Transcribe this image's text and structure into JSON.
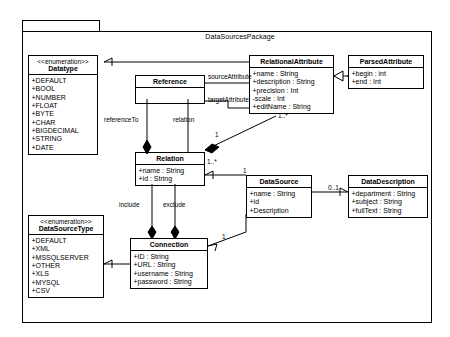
{
  "package": {
    "title": "DataSourcesPackage"
  },
  "classes": {
    "datatype": {
      "stereotype": "<<enumeration>>",
      "name": "Datatype",
      "members": [
        "+DEFAULT",
        "+BOOL",
        "+NUMBER",
        "+FLOAT",
        "+BYTE",
        "+CHAR",
        "+BIGDECIMAL",
        "+STRING",
        "+DATE"
      ]
    },
    "reference": {
      "name": "Reference",
      "members": []
    },
    "relational_attribute": {
      "name": "RelationalAttribute",
      "members": [
        "+name : String",
        "+description : String",
        "+precision : Int",
        "-scale : Int",
        "+editName : String"
      ]
    },
    "parsed_attribute": {
      "name": "ParsedAttribute",
      "members": [
        "+begin : int",
        "+end : Int"
      ]
    },
    "relation": {
      "name": "Relation",
      "members": [
        "+name : String",
        "+id : String"
      ]
    },
    "data_source": {
      "name": "DataSource",
      "members": [
        "+name : String",
        "+id",
        "+Description"
      ]
    },
    "data_description": {
      "name": "DataDescription",
      "members": [
        "+department : String",
        "+subject : String",
        "+fullText : String"
      ]
    },
    "data_source_type": {
      "stereotype": "<<enumeration>>",
      "name": "DataSourceType",
      "members": [
        "+DEFAULT",
        "+XML",
        "+MSSQLSERVER",
        "+OTHER",
        "+XLS",
        "+MYSQL",
        "+CSV"
      ]
    },
    "connection": {
      "name": "Connection",
      "members": [
        "+ID : String",
        "+URL : String",
        "+username : String",
        "+password : String"
      ]
    }
  },
  "associations": {
    "source_attribute": "sourceAttribute",
    "target_attribute": "targetAttribute",
    "reference_to": "referenceTo",
    "relation": "relation",
    "include": "include",
    "exclude": "exclude"
  },
  "multiplicities": {
    "relation_one": "1",
    "relational_many": "1..*",
    "relation_star": "1..*",
    "datasource_one": "1",
    "datadescription_zero_one": "0..1",
    "connection_one": "1"
  },
  "colors": {
    "line": "#000000",
    "background": "#ffffff"
  }
}
